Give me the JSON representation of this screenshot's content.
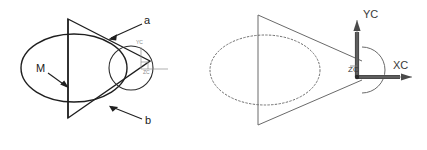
{
  "figure": {
    "background_color": "#ffffff",
    "ink_color": "#1f1f1f",
    "soft_ink_color": "#6a6a6a",
    "axis_color": "#4a4a4a"
  },
  "left_figure": {
    "name": "cone-and-circle-section-view",
    "labels": {
      "upper_leader": "a",
      "lower_leader": "b",
      "section_mark": "M",
      "axis_y": "YC",
      "axis_z": "ZC"
    }
  },
  "right_figure": {
    "name": "cad-coordinate-system-view",
    "labels": {
      "axis_y": "YC",
      "axis_x": "XC",
      "axis_z": "ZC"
    }
  }
}
